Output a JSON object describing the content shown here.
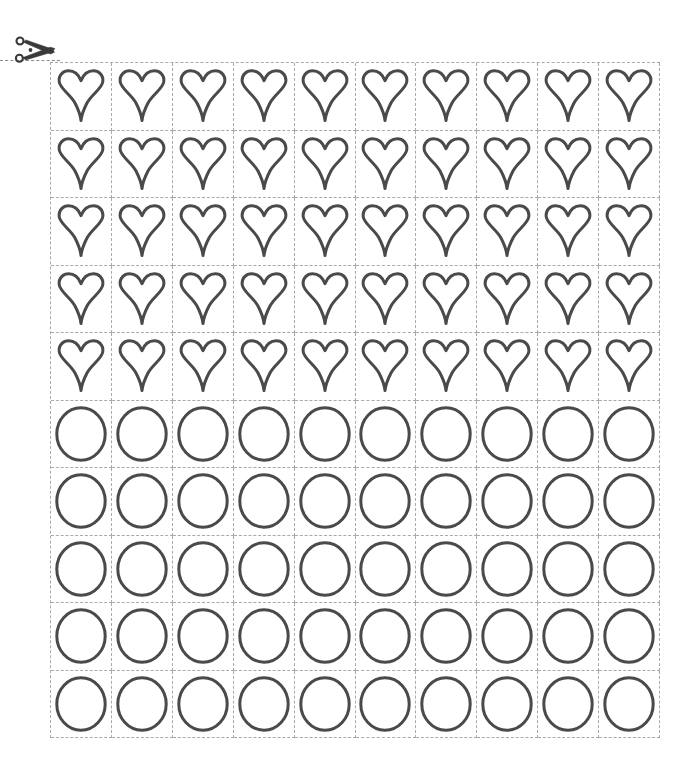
{
  "document": {
    "title": "Cut-out Shapes Worksheet",
    "background_color": "#ffffff"
  },
  "cut_guide": {
    "icon": "scissors-icon",
    "icon_label": "scissors",
    "icon_color": "#3a3a3a",
    "line_style": "dashed",
    "line_color": "#8a8a8a",
    "line_label": "cut along the dashed line"
  },
  "grid": {
    "columns": 10,
    "rows": 10,
    "total_cells": 100,
    "line_style": "dashed",
    "line_color": "#a9a9a9",
    "cell_width_px": 61,
    "cell_height_px": 67.6,
    "origin_x_px": 50,
    "origin_y_px": 62,
    "width_px": 610,
    "height_px": 676
  },
  "shapes": {
    "stroke_color": "#4a4a4a",
    "fill_color": "#ffffff",
    "stroke_width_px": 3,
    "row_shapes": [
      "heart",
      "heart",
      "heart",
      "heart",
      "heart",
      "circle",
      "circle",
      "circle",
      "circle",
      "circle"
    ],
    "counts": {
      "heart": 50,
      "circle": 50
    },
    "labels": {
      "heart": "heart",
      "circle": "circle"
    }
  }
}
